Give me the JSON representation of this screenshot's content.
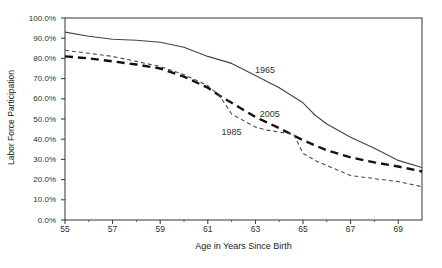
{
  "chart_data": {
    "type": "line",
    "title": "",
    "xlabel": "Age in Years Since Birth",
    "ylabel": "Labor Force Participation",
    "xlim": [
      55,
      70
    ],
    "ylim": [
      0,
      100
    ],
    "grid": false,
    "legend": "inline-annotations",
    "axis_color": "#333333",
    "x_ticks": [
      {
        "value": 55,
        "label": "55"
      },
      {
        "value": 57,
        "label": "57"
      },
      {
        "value": 59,
        "label": "59"
      },
      {
        "value": 61,
        "label": "61"
      },
      {
        "value": 63,
        "label": "63"
      },
      {
        "value": 65,
        "label": "65"
      },
      {
        "value": 67,
        "label": "67"
      },
      {
        "value": 69,
        "label": "69"
      }
    ],
    "x_minor_ticks": [
      56,
      58,
      60,
      62,
      64,
      66,
      68
    ],
    "y_ticks": [
      {
        "value": 0,
        "label": "0.0%"
      },
      {
        "value": 10,
        "label": "10.0%"
      },
      {
        "value": 20,
        "label": "20.0%"
      },
      {
        "value": 30,
        "label": "30.0%"
      },
      {
        "value": 40,
        "label": "40.0%"
      },
      {
        "value": 50,
        "label": "50.0%"
      },
      {
        "value": 60,
        "label": "60.0%"
      },
      {
        "value": 70,
        "label": "70.0%"
      },
      {
        "value": 80,
        "label": "80.0%"
      },
      {
        "value": 90,
        "label": "90.0%"
      },
      {
        "value": 100,
        "label": "100.0%"
      }
    ],
    "series": [
      {
        "name": "1965",
        "line_style": "solid",
        "color": "#444444",
        "stroke_width": 1.1,
        "label_anchor": {
          "x": 63.4,
          "y": 74.5
        },
        "points": [
          [
            55,
            93
          ],
          [
            56,
            91
          ],
          [
            57,
            89.5
          ],
          [
            58,
            89
          ],
          [
            59,
            88
          ],
          [
            60,
            85.5
          ],
          [
            61,
            81
          ],
          [
            62,
            77.5
          ],
          [
            63,
            71.5
          ],
          [
            64,
            65.5
          ],
          [
            65,
            58
          ],
          [
            65.5,
            52
          ],
          [
            66,
            47.5
          ],
          [
            67,
            41
          ],
          [
            68,
            35.5
          ],
          [
            69,
            29.5
          ],
          [
            70,
            26
          ]
        ]
      },
      {
        "name": "2005",
        "line_style": "long-dash-bold",
        "color": "#111111",
        "stroke_width": 2.4,
        "label_anchor": {
          "x": 63.6,
          "y": 52.5
        },
        "points": [
          [
            55,
            81
          ],
          [
            56,
            80
          ],
          [
            57,
            78.5
          ],
          [
            58,
            77
          ],
          [
            59,
            75
          ],
          [
            60,
            71
          ],
          [
            61,
            65.5
          ],
          [
            61.5,
            61.5
          ],
          [
            62,
            58
          ],
          [
            63,
            51
          ],
          [
            64,
            45.5
          ],
          [
            65,
            39.5
          ],
          [
            66,
            34.5
          ],
          [
            67,
            31
          ],
          [
            68,
            28.5
          ],
          [
            69,
            26.5
          ],
          [
            70,
            24
          ]
        ]
      },
      {
        "name": "1985",
        "line_style": "short-dash",
        "color": "#4a4a4a",
        "stroke_width": 1.1,
        "label_anchor": {
          "x": 62.0,
          "y": 43.8
        },
        "points": [
          [
            55,
            84
          ],
          [
            56,
            82.5
          ],
          [
            57,
            81
          ],
          [
            58,
            78.5
          ],
          [
            59,
            76
          ],
          [
            60,
            72
          ],
          [
            61,
            66.5
          ],
          [
            61.5,
            61.5
          ],
          [
            62,
            52.5
          ],
          [
            63,
            46
          ],
          [
            63.5,
            44.5
          ],
          [
            64,
            43.5
          ],
          [
            64.6,
            42.5
          ],
          [
            65,
            33
          ],
          [
            65.5,
            29.5
          ],
          [
            66,
            27
          ],
          [
            67,
            22
          ],
          [
            68,
            20.5
          ],
          [
            69,
            19
          ],
          [
            70,
            16.5
          ]
        ]
      }
    ]
  }
}
